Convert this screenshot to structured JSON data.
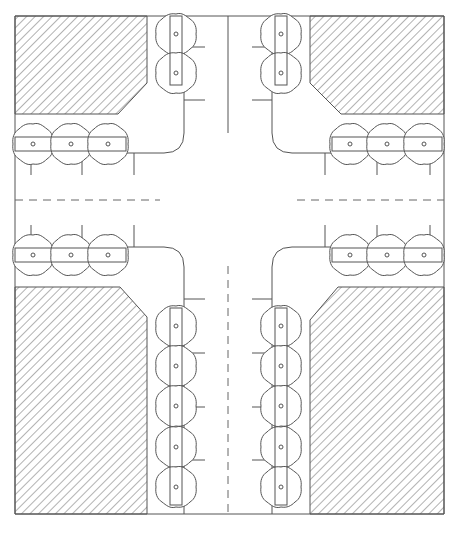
{
  "drawing": {
    "title": "Intersection street-tree planting plan",
    "colors": {
      "line": "#555555",
      "hatch": "#666666",
      "background": "#ffffff"
    },
    "outer_boundary": {
      "x1": 15,
      "y1": 16,
      "x2": 444,
      "y2": 520
    },
    "centerlines": {
      "vertical_x": 228,
      "horizontal_y": 200
    },
    "blocks": [
      {
        "name": "block-top-left",
        "points": "15,16 147,16 147,83 118,114 15,114"
      },
      {
        "name": "block-top-right",
        "points": "310,16 444,16 444,114 341,114 310,83"
      },
      {
        "name": "block-bottom-left",
        "points": "15,287 120,287 147,317 147,514 15,514"
      },
      {
        "name": "block-bottom-right",
        "points": "310,320 338,287 444,287 444,514 310,514"
      }
    ],
    "tree_rows": [
      {
        "name": "tree-row-top-left-vertical",
        "orientation": "vertical",
        "trees": [
          [
            176,
            34
          ],
          [
            176,
            73
          ]
        ]
      },
      {
        "name": "tree-row-top-right-vertical",
        "orientation": "vertical",
        "trees": [
          [
            281,
            34
          ],
          [
            281,
            73
          ]
        ]
      },
      {
        "name": "tree-row-top-left-horizontal",
        "orientation": "horizontal",
        "trees": [
          [
            33,
            144
          ],
          [
            71,
            144
          ],
          [
            108,
            144
          ]
        ]
      },
      {
        "name": "tree-row-top-right-horizontal",
        "orientation": "horizontal",
        "trees": [
          [
            350,
            144
          ],
          [
            387,
            144
          ],
          [
            424,
            144
          ]
        ]
      },
      {
        "name": "tree-row-mid-left-horizontal",
        "orientation": "horizontal",
        "trees": [
          [
            33,
            255
          ],
          [
            71,
            255
          ],
          [
            108,
            255
          ]
        ]
      },
      {
        "name": "tree-row-mid-right-horizontal",
        "orientation": "horizontal",
        "trees": [
          [
            350,
            255
          ],
          [
            387,
            255
          ],
          [
            424,
            255
          ]
        ]
      },
      {
        "name": "tree-row-bottom-left-vertical",
        "orientation": "vertical",
        "trees": [
          [
            176,
            326
          ],
          [
            176,
            366
          ],
          [
            176,
            406
          ],
          [
            176,
            447
          ],
          [
            176,
            487
          ]
        ]
      },
      {
        "name": "tree-row-bottom-right-vertical",
        "orientation": "vertical",
        "trees": [
          [
            281,
            326
          ],
          [
            281,
            366
          ],
          [
            281,
            406
          ],
          [
            281,
            447
          ],
          [
            281,
            487
          ]
        ]
      }
    ],
    "tree_count": 24
  }
}
